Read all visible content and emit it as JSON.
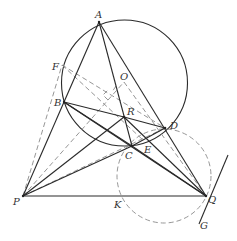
{
  "diagram": {
    "type": "geometry",
    "circle_main": {
      "cx": 124.5,
      "cy": 83,
      "r": 63,
      "center_label": "O"
    },
    "circle_dashed": {
      "cx": 164,
      "cy": 176,
      "r": 47
    },
    "points": {
      "A": {
        "x": 99,
        "y": 22,
        "label": "A"
      },
      "B": {
        "x": 64,
        "y": 102,
        "label": "B"
      },
      "C": {
        "x": 132,
        "y": 146,
        "label": "C"
      },
      "D": {
        "x": 165,
        "y": 128,
        "label": "D"
      },
      "E": {
        "x": 143,
        "y": 140,
        "label": "E"
      },
      "F": {
        "x": 62,
        "y": 65,
        "label": "F"
      },
      "O": {
        "x": 124,
        "y": 82,
        "label": "O"
      },
      "R": {
        "x": 124,
        "y": 117,
        "label": "R"
      },
      "P": {
        "x": 23,
        "y": 196,
        "label": "P"
      },
      "K": {
        "x": 123,
        "y": 196,
        "label": "K"
      },
      "Q": {
        "x": 206,
        "y": 196,
        "label": "Q"
      },
      "G": {
        "x": 200,
        "y": 218,
        "label": "G"
      }
    },
    "labels": {
      "A": "A",
      "B": "B",
      "C": "C",
      "D": "D",
      "E": "E",
      "F": "F",
      "O": "O",
      "R": "R",
      "P": "P",
      "K": "K",
      "Q": "Q",
      "G": "G"
    },
    "solid_segments": [
      [
        "A",
        "B"
      ],
      [
        "A",
        "C"
      ],
      [
        "A",
        "Q"
      ],
      [
        "P",
        "B"
      ],
      [
        "P",
        "R"
      ],
      [
        "P",
        "C"
      ],
      [
        "P",
        "Q"
      ],
      [
        "B",
        "D"
      ],
      [
        "B",
        "Q"
      ],
      [
        "R",
        "Q"
      ],
      [
        "C",
        "Q"
      ],
      [
        "R",
        "C"
      ],
      [
        "C",
        "D"
      ],
      [
        "Q",
        "G"
      ]
    ],
    "dashed_segments": [
      [
        "P",
        "F"
      ],
      [
        "P",
        "O"
      ],
      [
        "F",
        "O"
      ],
      [
        "F",
        "E"
      ],
      [
        "O",
        "Q"
      ],
      [
        "P",
        "D"
      ]
    ],
    "colors": {
      "solid": "#2a2a2a",
      "dashed": "#8a8a8a",
      "text": "#333333",
      "background": "#ffffff"
    }
  }
}
